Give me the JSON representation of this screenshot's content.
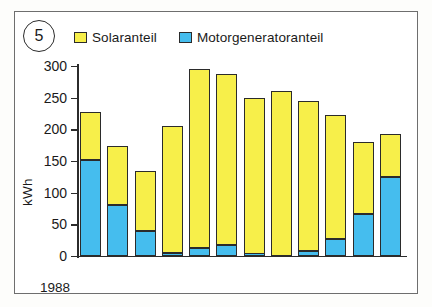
{
  "figure": {
    "number": "5",
    "badge_name": "figure-number-5"
  },
  "legend": {
    "position": "top",
    "items": [
      {
        "label": "Solaranteil",
        "color": "#f7ef4a",
        "key": "solar"
      },
      {
        "label": "Motorgeneratoranteil",
        "color": "#45bdee",
        "key": "motor"
      }
    ]
  },
  "axes": {
    "ylabel": "kWh",
    "yticks": [
      "0",
      "50",
      "100",
      "150",
      "200",
      "250",
      "300"
    ],
    "year": "1988"
  },
  "chart_data": {
    "type": "bar",
    "subtype": "stacked",
    "title": "",
    "xlabel": "1988",
    "ylabel": "kWh",
    "ylim": [
      0,
      300
    ],
    "yticks": [
      0,
      50,
      100,
      150,
      200,
      250,
      300
    ],
    "grid": false,
    "legend_position": "top",
    "categories": [
      "Jan",
      "Feb",
      "Mär",
      "Apr",
      "Mai",
      "Jun",
      "Jul",
      "Aug",
      "Sep",
      "Okt",
      "Nov",
      "Dez"
    ],
    "series": [
      {
        "name": "Motorgeneratoranteil",
        "color": "#45bdee",
        "values": [
          152,
          80,
          40,
          5,
          12,
          18,
          2,
          0,
          8,
          27,
          67,
          125
        ]
      },
      {
        "name": "Solaranteil",
        "color": "#f7ef4a",
        "values": [
          76,
          93,
          95,
          200,
          283,
          270,
          248,
          260,
          237,
          195,
          113,
          67
        ]
      }
    ],
    "totals": [
      228,
      173,
      135,
      205,
      295,
      288,
      250,
      260,
      245,
      222,
      180,
      192
    ],
    "units": "kWh"
  }
}
